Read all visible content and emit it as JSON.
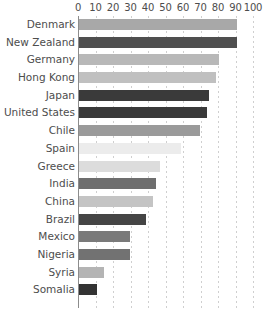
{
  "chart_data": {
    "type": "bar",
    "orientation": "horizontal",
    "title": "",
    "subtitle": "",
    "xlabel": "",
    "ylabel": "",
    "xlim": [
      0,
      100
    ],
    "ylim": null,
    "grid": true,
    "grid_axis": "x",
    "legend": false,
    "legend_position": "none",
    "axis_ticks": [
      "0",
      "10",
      "20",
      "30",
      "40",
      "50",
      "60",
      "70",
      "80",
      "90",
      "100"
    ],
    "tick_values": [
      0,
      10,
      20,
      30,
      40,
      50,
      60,
      70,
      80,
      90,
      100
    ],
    "categories": [
      "Denmark",
      "New Zealand",
      "Germany",
      "Hong Kong",
      "Japan",
      "United States",
      "Chile",
      "Spain",
      "Greece",
      "India",
      "China",
      "Brazil",
      "Mexico",
      "Nigeria",
      "Syria",
      "Somalia"
    ],
    "values": [
      90,
      90,
      80,
      78,
      74,
      73,
      69,
      58,
      46,
      44,
      42,
      38,
      29,
      29,
      14,
      10
    ],
    "bar_colors": [
      "#a8a8a8",
      "#4f4f4f",
      "#b8b8b8",
      "#c0c0c0",
      "#3a3a3a",
      "#3a3a3a",
      "#9a9a9a",
      "#ececec",
      "#dcdcdc",
      "#6e6e6e",
      "#c4c4c4",
      "#454545",
      "#7a7a7a",
      "#727272",
      "#b4b4b4",
      "#333333"
    ],
    "bars": [
      {
        "label": "Denmark",
        "value": 90,
        "color": "#a8a8a8"
      },
      {
        "label": "New Zealand",
        "value": 90,
        "color": "#4f4f4f"
      },
      {
        "label": "Germany",
        "value": 80,
        "color": "#b8b8b8"
      },
      {
        "label": "Hong Kong",
        "value": 78,
        "color": "#c0c0c0"
      },
      {
        "label": "Japan",
        "value": 74,
        "color": "#3a3a3a"
      },
      {
        "label": "United States",
        "value": 73,
        "color": "#3a3a3a"
      },
      {
        "label": "Chile",
        "value": 69,
        "color": "#9a9a9a"
      },
      {
        "label": "Spain",
        "value": 58,
        "color": "#ececec"
      },
      {
        "label": "Greece",
        "value": 46,
        "color": "#dcdcdc"
      },
      {
        "label": "India",
        "value": 44,
        "color": "#6e6e6e"
      },
      {
        "label": "China",
        "value": 42,
        "color": "#c4c4c4"
      },
      {
        "label": "Brazil",
        "value": 38,
        "color": "#454545"
      },
      {
        "label": "Mexico",
        "value": 29,
        "color": "#7a7a7a"
      },
      {
        "label": "Nigeria",
        "value": 29,
        "color": "#727272"
      },
      {
        "label": "Syria",
        "value": 14,
        "color": "#b4b4b4"
      },
      {
        "label": "Somalia",
        "value": 10,
        "color": "#333333"
      }
    ],
    "colors": {
      "background": "#ffffff",
      "text": "#4d4d4d",
      "gridline": "#cfcfcf",
      "axis_line": "#8c8c8c"
    }
  }
}
